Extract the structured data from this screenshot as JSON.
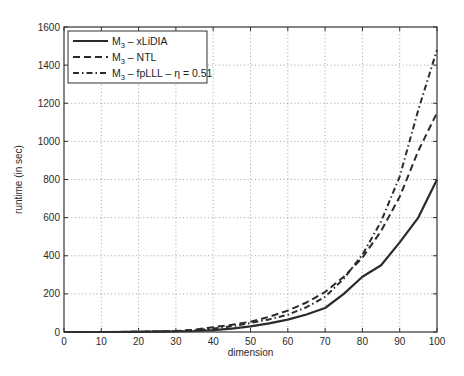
{
  "chart_data": {
    "type": "line",
    "title": "",
    "xlabel": "dimension",
    "ylabel": "runtime (in sec)",
    "xlim": [
      0,
      100
    ],
    "ylim": [
      0,
      1600
    ],
    "grid": true,
    "legend_position": "upper left",
    "xticks": [
      0,
      10,
      20,
      30,
      40,
      50,
      60,
      70,
      80,
      90,
      100
    ],
    "yticks": [
      0,
      200,
      400,
      600,
      800,
      1000,
      1200,
      1400,
      1600
    ],
    "x": [
      0,
      10,
      20,
      30,
      35,
      40,
      45,
      50,
      55,
      60,
      65,
      70,
      75,
      80,
      85,
      90,
      95,
      100
    ],
    "series": [
      {
        "name": "M3 – xLiDIA",
        "legend_main": "M",
        "legend_sub": "3",
        "legend_rest": " – xLiDIA",
        "style": "solid",
        "values": [
          0,
          0,
          1,
          3,
          5,
          10,
          18,
          30,
          45,
          65,
          92,
          126,
          200,
          290,
          350,
          470,
          600,
          800
        ]
      },
      {
        "name": "M3 – NTL",
        "legend_main": "M",
        "legend_sub": "3",
        "legend_rest": " – NTL",
        "style": "dashed",
        "values": [
          0,
          0,
          1,
          5,
          12,
          25,
          38,
          54,
          80,
          112,
          155,
          210,
          290,
          390,
          530,
          710,
          950,
          1150
        ]
      },
      {
        "name": "M3 – fpLLL – η = 0.51",
        "legend_main": "M",
        "legend_sub": "3",
        "legend_rest": " – fpLLL – η = 0.51",
        "style": "dashdot",
        "values": [
          0,
          0,
          1,
          4,
          9,
          18,
          30,
          47,
          66,
          90,
          130,
          184,
          280,
          405,
          580,
          815,
          1165,
          1480
        ]
      }
    ]
  }
}
